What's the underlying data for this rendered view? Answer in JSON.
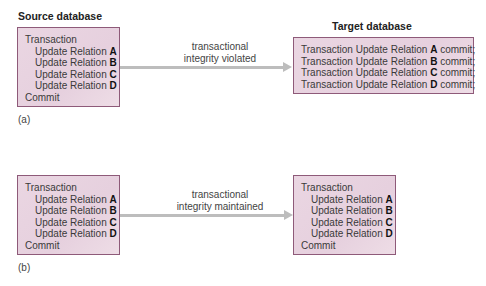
{
  "panel_a": {
    "source_title": "Source database",
    "target_title": "Target database",
    "source_lines": {
      "l0": "Transaction",
      "l1": {
        "text": "Update Relation ",
        "rel": "A"
      },
      "l2": {
        "text": "Update Relation ",
        "rel": "B"
      },
      "l3": {
        "text": "Update Relation ",
        "rel": "C"
      },
      "l4": {
        "text": "Update Relation ",
        "rel": "D"
      },
      "l5": "Commit"
    },
    "arrow_label_1": "transactional",
    "arrow_label_2": "integrity violated",
    "target_lines": [
      {
        "pre": "Transaction Update Relation ",
        "rel": "A",
        "post": " commit;"
      },
      {
        "pre": "Transaction Update Relation ",
        "rel": "B",
        "post": " commit;"
      },
      {
        "pre": "Transaction Update Relation ",
        "rel": "C",
        "post": " commit;"
      },
      {
        "pre": "Transaction Update Relation ",
        "rel": "D",
        "post": " commit;"
      }
    ],
    "caption": "(a)"
  },
  "panel_b": {
    "source_lines": {
      "l0": "Transaction",
      "l1": {
        "text": "Update Relation ",
        "rel": "A"
      },
      "l2": {
        "text": "Update Relation ",
        "rel": "B"
      },
      "l3": {
        "text": "Update Relation ",
        "rel": "C"
      },
      "l4": {
        "text": "Update Relation ",
        "rel": "D"
      },
      "l5": "Commit"
    },
    "arrow_label_1": "transactional",
    "arrow_label_2": "integrity maintained",
    "target_lines": {
      "l0": "Transaction",
      "l1": {
        "text": "Update Relation ",
        "rel": "A"
      },
      "l2": {
        "text": "Update Relation ",
        "rel": "B"
      },
      "l3": {
        "text": "Update Relation ",
        "rel": "C"
      },
      "l4": {
        "text": "Update Relation ",
        "rel": "D"
      },
      "l5": "Commit"
    },
    "caption": "(b)"
  }
}
